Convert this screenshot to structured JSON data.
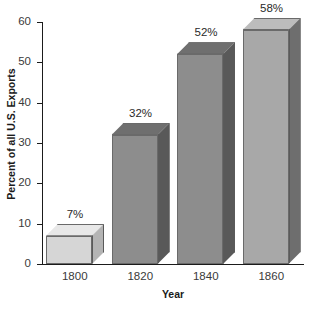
{
  "chart_data": {
    "type": "bar",
    "title": "",
    "xlabel": "Year",
    "ylabel": "Percent of all U.S. Exports",
    "categories": [
      "1800",
      "1820",
      "1840",
      "1860"
    ],
    "values": [
      7,
      32,
      52,
      58
    ],
    "data_labels": [
      "7%",
      "32%",
      "52%",
      "58%"
    ],
    "ylim": [
      0,
      60
    ],
    "yticks": [
      0,
      10,
      20,
      30,
      40,
      50,
      60
    ],
    "ytick_labels": [
      "0",
      "10",
      "20",
      "30",
      "40",
      "50",
      "60"
    ],
    "grid": false,
    "legend": false,
    "style": "3d-bars",
    "bar_colors": [
      "#d6d6d6",
      "#8d8d8d",
      "#8d8d8d",
      "#a8a8a8"
    ],
    "bar_top_colors": [
      "#e8e8e8",
      "#6f6f6f",
      "#6f6f6f",
      "#bcbcbc"
    ],
    "bar_side_colors": [
      "#b4b4b4",
      "#595959",
      "#595959",
      "#6e6e6e"
    ],
    "background_color": "#ffffff",
    "axis_color": "#1b1b1b"
  }
}
